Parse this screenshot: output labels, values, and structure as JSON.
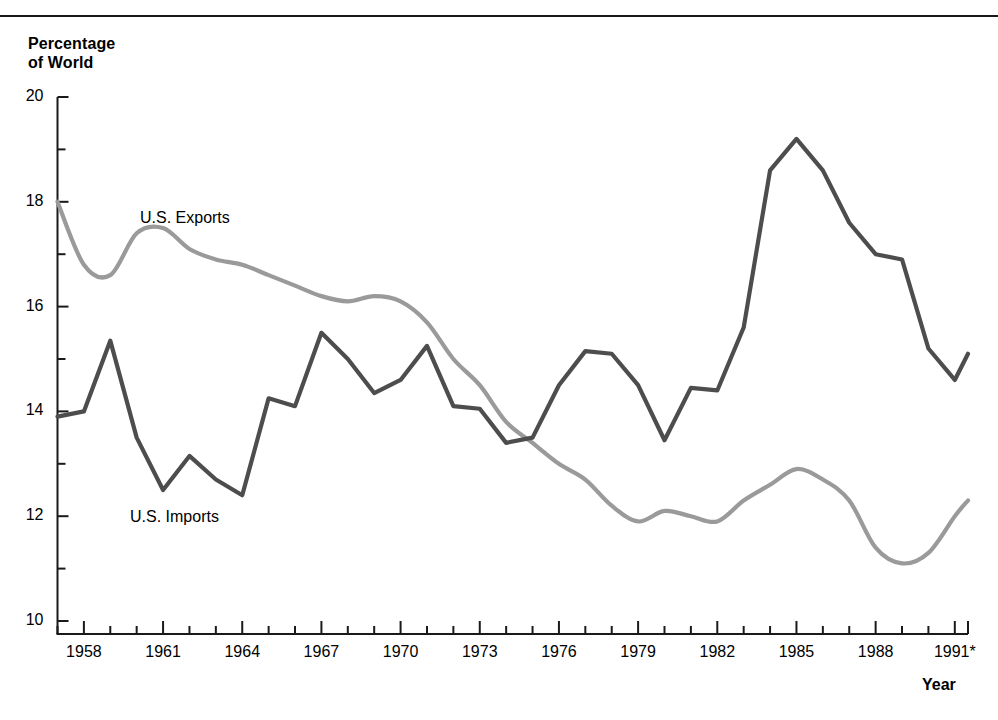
{
  "chart_data": {
    "type": "line",
    "title": "",
    "ylabel": "Percentage of World",
    "xlabel": "Year",
    "ylim": [
      10,
      20
    ],
    "xlim": [
      1957,
      1991.5
    ],
    "grid": false,
    "legend_position": "inline-annotations",
    "ytick_labels": [
      "10",
      "12",
      "14",
      "16",
      "18",
      "20"
    ],
    "ytick_values": [
      10,
      12,
      14,
      16,
      18,
      20
    ],
    "yminor_values": [
      11,
      13,
      15,
      17,
      19
    ],
    "xtick_labels": [
      "1958",
      "1961",
      "1964",
      "1967",
      "1970",
      "1973",
      "1976",
      "1979",
      "1982",
      "1985",
      "1988",
      "1991*"
    ],
    "xtick_values": [
      1958,
      1961,
      1964,
      1967,
      1970,
      1973,
      1976,
      1979,
      1982,
      1985,
      1988,
      1991
    ],
    "xminor_start": 1957,
    "xminor_end": 1991,
    "x": [
      1957,
      1958,
      1959,
      1960,
      1961,
      1962,
      1963,
      1964,
      1965,
      1966,
      1967,
      1968,
      1969,
      1970,
      1971,
      1972,
      1973,
      1974,
      1975,
      1976,
      1977,
      1978,
      1979,
      1980,
      1981,
      1982,
      1983,
      1984,
      1985,
      1986,
      1987,
      1988,
      1989,
      1990,
      1991
    ],
    "series": [
      {
        "name": "U.S. Exports",
        "color": "#9a9a9a",
        "smoothing": "spline",
        "label_text": "U.S. Exports",
        "values": [
          18.0,
          16.8,
          16.6,
          17.4,
          17.5,
          17.1,
          16.9,
          16.8,
          16.6,
          16.4,
          16.2,
          16.1,
          16.2,
          16.1,
          15.7,
          15.0,
          14.5,
          13.8,
          13.4,
          13.0,
          12.7,
          12.2,
          11.9,
          12.1,
          12.0,
          11.9,
          12.3,
          12.6,
          12.9,
          12.7,
          12.3,
          11.4,
          11.1,
          11.3,
          12.0
        ]
      },
      {
        "name": "U.S. Imports",
        "color": "#4d4d4d",
        "smoothing": "linear",
        "label_text": "U.S. Imports",
        "values": [
          13.9,
          14.0,
          15.35,
          13.5,
          12.5,
          13.15,
          12.7,
          12.4,
          14.25,
          14.1,
          15.5,
          15.0,
          14.35,
          14.6,
          15.25,
          14.1,
          14.05,
          13.4,
          13.5,
          14.5,
          15.15,
          15.1,
          14.5,
          13.45,
          14.45,
          14.4,
          15.6,
          18.6,
          19.2,
          18.6,
          17.6,
          17.0,
          16.9,
          15.2,
          14.6
        ]
      }
    ],
    "extra_points": {
      "exports_tail_x": 1991.5,
      "exports_tail_y": 12.3,
      "imports_tail_x": 1991.5,
      "imports_tail_y": 15.1
    },
    "annotations": [
      {
        "text": "U.S. Exports",
        "x": 1960.2,
        "y": 17.95
      },
      {
        "text": "U.S. Imports",
        "x": 1959.8,
        "y": 12.35
      }
    ]
  },
  "axis": {
    "y_title_line1": "Percentage",
    "y_title_line2": "of World",
    "x_title": "Year"
  }
}
